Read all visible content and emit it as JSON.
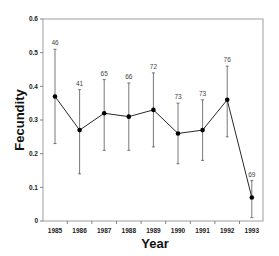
{
  "chart_data": {
    "type": "line",
    "title": "",
    "xlabel": "Year",
    "ylabel": "Fecundity",
    "ylim": [
      0,
      0.6
    ],
    "yticks": [
      0,
      0.1,
      0.2,
      0.3,
      0.4,
      0.5,
      0.6
    ],
    "ytick_labels": [
      "0",
      "0.1",
      "0.2",
      "0.3",
      "0.4",
      "0.5",
      "0.6"
    ],
    "categories": [
      "1985",
      "1986",
      "1987",
      "1988",
      "1989",
      "1990",
      "1991",
      "1992",
      "1993"
    ],
    "grid": false,
    "legend": null,
    "series": [
      {
        "name": "Fecundity",
        "values": [
          0.37,
          0.27,
          0.32,
          0.31,
          0.33,
          0.26,
          0.27,
          0.36,
          0.07
        ],
        "error_upper": [
          0.51,
          0.39,
          0.42,
          0.41,
          0.44,
          0.35,
          0.36,
          0.46,
          0.12
        ],
        "error_lower": [
          0.23,
          0.14,
          0.21,
          0.21,
          0.22,
          0.17,
          0.18,
          0.25,
          0.01
        ],
        "sample_sizes": [
          "46",
          "41",
          "65",
          "66",
          "72",
          "73",
          "73",
          "76",
          "69"
        ]
      }
    ],
    "colors": {
      "line": "#111111",
      "marker": "#000000",
      "errorbar": "#555555",
      "frame": "#888888"
    }
  }
}
